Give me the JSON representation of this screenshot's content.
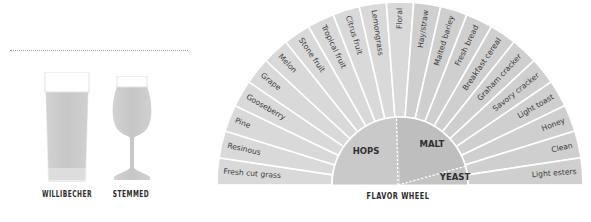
{
  "glasses": [
    {
      "name": "willibecher",
      "label": "WILLIBECHER",
      "center_x": 67
    },
    {
      "name": "stemmed",
      "label": "STEMMED",
      "center_x": 131
    }
  ],
  "wheel": {
    "caption": "FLAVOR WHEEL",
    "center": [
      400,
      185
    ],
    "outer_radius": 183,
    "inner_radius": 68,
    "colors": {
      "hops_wedge": "#d9d9d9",
      "malt_wedge": "#cfcfcf",
      "hops_hub": "#c9c9c9",
      "malt_hub": "#bebebe",
      "yeast_hub": "#c4c4c4",
      "wedge_divider": "#ffffff",
      "label": "#3a3a3a"
    },
    "hub": [
      {
        "name": "hops",
        "label": "HOPS",
        "start_deg": 180,
        "end_deg": 93
      },
      {
        "name": "malt",
        "label": "MALT",
        "start_deg": 93,
        "end_deg": 16
      },
      {
        "name": "yeast",
        "label": "YEAST",
        "start_deg": 16,
        "end_deg": 0
      }
    ],
    "wedges": [
      {
        "label": "Fresh cut grass",
        "group": "hops"
      },
      {
        "label": "Resinous",
        "group": "hops"
      },
      {
        "label": "Pine",
        "group": "hops"
      },
      {
        "label": "Gooseberry",
        "group": "hops"
      },
      {
        "label": "Grape",
        "group": "hops"
      },
      {
        "label": "Melon",
        "group": "hops"
      },
      {
        "label": "Stone fruit",
        "group": "hops"
      },
      {
        "label": "Tropical fruit",
        "group": "hops"
      },
      {
        "label": "Citrus fruit",
        "group": "hops"
      },
      {
        "label": "Lemongrass",
        "group": "hops"
      },
      {
        "label": "Floral",
        "group": "hops"
      },
      {
        "label": "Hay/straw",
        "group": "malt"
      },
      {
        "label": "Malted barley",
        "group": "malt"
      },
      {
        "label": "Fresh bread",
        "group": "malt"
      },
      {
        "label": "Breakfast cereal",
        "group": "malt"
      },
      {
        "label": "Graham cracker",
        "group": "malt"
      },
      {
        "label": "Savory cracker",
        "group": "malt"
      },
      {
        "label": "Light toast",
        "group": "malt"
      },
      {
        "label": "Honey",
        "group": "malt"
      },
      {
        "label": "Clean",
        "group": "malt"
      },
      {
        "label": "Light esters",
        "group": "yeast"
      }
    ]
  }
}
